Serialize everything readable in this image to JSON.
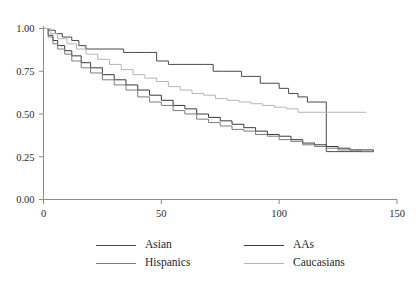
{
  "caption_fragment": "",
  "chart_data": {
    "type": "line",
    "title": "",
    "subtitle": "",
    "xlabel": "",
    "ylabel": "",
    "xlim": [
      0,
      150
    ],
    "ylim": [
      0.0,
      1.0
    ],
    "xticks": [
      0,
      50,
      100,
      150
    ],
    "xtick_labels": [
      "0",
      "50",
      "100",
      "150"
    ],
    "yticks": [
      0.0,
      0.25,
      0.5,
      0.75,
      1.0
    ],
    "ytick_labels": [
      "0.00",
      "0.25",
      "0.50",
      "0.75",
      "1.00"
    ],
    "grid": false,
    "legend_position": "bottom",
    "step_type": "post",
    "series": [
      {
        "name": "Asian",
        "color": "#4a4a4a",
        "x": [
          0,
          2,
          5,
          8,
          12,
          15,
          18,
          21,
          24,
          27,
          30,
          34,
          38,
          43,
          48,
          53,
          58,
          63,
          68,
          72,
          76,
          80,
          84,
          88,
          92,
          96,
          100,
          104,
          108,
          112,
          116,
          120,
          120,
          124,
          128,
          132,
          136,
          140
        ],
        "y": [
          1.0,
          0.99,
          0.97,
          0.95,
          0.93,
          0.9,
          0.88,
          0.88,
          0.88,
          0.88,
          0.88,
          0.86,
          0.86,
          0.86,
          0.81,
          0.79,
          0.79,
          0.79,
          0.79,
          0.75,
          0.75,
          0.75,
          0.72,
          0.72,
          0.68,
          0.68,
          0.65,
          0.62,
          0.6,
          0.57,
          0.57,
          0.57,
          0.28,
          0.28,
          0.28,
          0.28,
          0.28,
          0.28
        ]
      },
      {
        "name": "AAs",
        "color": "#3a3a3a",
        "x": [
          0,
          2,
          4,
          6,
          9,
          12,
          16,
          20,
          25,
          30,
          35,
          40,
          45,
          50,
          55,
          60,
          65,
          70,
          75,
          80,
          85,
          90,
          95,
          100,
          105,
          110,
          115,
          120,
          125,
          130,
          135,
          140
        ],
        "y": [
          1.0,
          0.96,
          0.93,
          0.9,
          0.87,
          0.84,
          0.8,
          0.77,
          0.73,
          0.7,
          0.67,
          0.64,
          0.61,
          0.58,
          0.55,
          0.53,
          0.5,
          0.48,
          0.46,
          0.44,
          0.42,
          0.4,
          0.38,
          0.37,
          0.35,
          0.33,
          0.32,
          0.31,
          0.3,
          0.29,
          0.29,
          0.28
        ]
      },
      {
        "name": "Hispanics",
        "color": "#7d7d7d",
        "x": [
          0,
          2,
          4,
          6,
          9,
          12,
          16,
          20,
          25,
          30,
          35,
          40,
          45,
          50,
          55,
          60,
          65,
          70,
          75,
          80,
          85,
          90,
          95,
          100,
          105,
          110,
          115,
          120,
          125,
          130,
          135,
          140
        ],
        "y": [
          1.0,
          0.95,
          0.91,
          0.88,
          0.85,
          0.81,
          0.77,
          0.74,
          0.7,
          0.67,
          0.64,
          0.6,
          0.57,
          0.55,
          0.52,
          0.5,
          0.47,
          0.45,
          0.43,
          0.41,
          0.4,
          0.38,
          0.37,
          0.35,
          0.34,
          0.32,
          0.31,
          0.3,
          0.29,
          0.29,
          0.28,
          0.28
        ]
      },
      {
        "name": "Caucasians",
        "color": "#b5b5b5",
        "x": [
          0,
          3,
          6,
          10,
          14,
          18,
          23,
          28,
          33,
          38,
          43,
          48,
          53,
          58,
          63,
          68,
          73,
          78,
          83,
          88,
          93,
          98,
          103,
          108,
          115,
          125,
          137
        ],
        "y": [
          1.0,
          0.97,
          0.94,
          0.91,
          0.88,
          0.85,
          0.82,
          0.79,
          0.76,
          0.73,
          0.71,
          0.69,
          0.66,
          0.64,
          0.62,
          0.61,
          0.59,
          0.58,
          0.57,
          0.56,
          0.55,
          0.54,
          0.53,
          0.51,
          0.51,
          0.51,
          0.51
        ]
      }
    ]
  },
  "legend": {
    "rows": [
      [
        {
          "label": "Asian",
          "color": "#4a4a4a"
        },
        {
          "label": "AAs",
          "color": "#3a3a3a"
        }
      ],
      [
        {
          "label": "Hispanics",
          "color": "#7d7d7d"
        },
        {
          "label": "Caucasians",
          "color": "#b5b5b5"
        }
      ]
    ]
  },
  "axis": {
    "line_color": "#8d8d8d"
  }
}
